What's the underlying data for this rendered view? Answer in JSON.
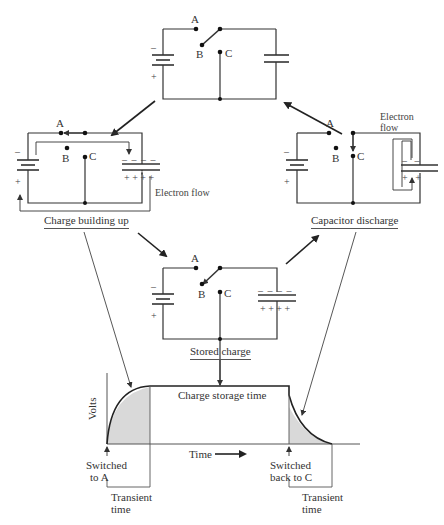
{
  "circuits": {
    "top": {
      "switch_position": "B",
      "terminals": [
        "A",
        "B",
        "C"
      ],
      "battery_polarity": {
        "top": "–",
        "bottom": "+"
      }
    },
    "charging": {
      "switch_position": "A",
      "terminals": [
        "A",
        "B",
        "C"
      ],
      "battery_polarity": {
        "top": "–",
        "bottom": "+"
      },
      "capacitor_plates": {
        "top": "– – – –",
        "bottom": "+ +  + +"
      },
      "flow_label": "Electron flow",
      "caption": "Charge building up"
    },
    "discharging": {
      "switch_position": "C",
      "terminals": [
        "A",
        "B",
        "C"
      ],
      "battery_polarity": {
        "top": "–",
        "bottom": "+"
      },
      "capacitor_plates": {
        "top": "–   –",
        "bottom": "+   +"
      },
      "flow_label_line1": "Electron",
      "flow_label_line2": "flow",
      "caption": "Capacitor discharge"
    },
    "stored": {
      "switch_position": "B",
      "terminals": [
        "A",
        "B",
        "C"
      ],
      "battery_polarity": {
        "top": "–",
        "bottom": "+"
      },
      "capacitor_plates": {
        "top": "– – – –",
        "bottom": "+ +  + +"
      },
      "caption": "Stored charge"
    }
  },
  "graph": {
    "y_label": "Volts",
    "x_label": "Time",
    "plateau_label": "Charge storage time",
    "event_a_line1": "Switched",
    "event_a_line2": "to A",
    "event_c_line1": "Switched",
    "event_c_line2": "back to C",
    "transient1_line1": "Transient",
    "transient1_line2": "time",
    "transient2_line1": "Transient",
    "transient2_line2": "time"
  },
  "colors": {
    "line": "#333333",
    "shade": "#d9d9d9"
  }
}
